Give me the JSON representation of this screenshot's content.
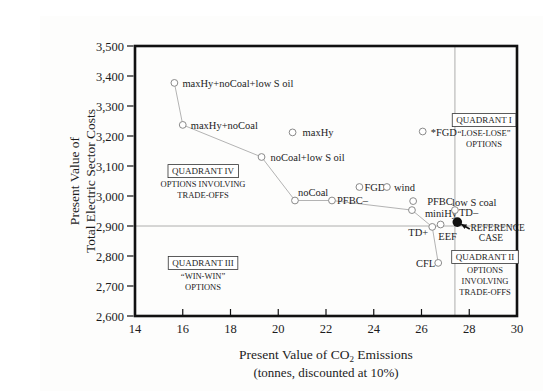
{
  "chart_data": {
    "type": "scatter",
    "title": "",
    "xlabel_line1": "Present Value of CO2 Emissions",
    "xlabel_line2": "(tonnes, discounted at 10%)",
    "ylabel_lines": [
      "Present Value of",
      "Total Electric Sector Costs"
    ],
    "xlim": [
      14,
      30
    ],
    "ylim": [
      2600,
      3500
    ],
    "xticks": [
      14,
      16,
      18,
      20,
      22,
      24,
      26,
      28,
      30
    ],
    "yticks": [
      2600,
      2700,
      2800,
      2900,
      3000,
      3100,
      3200,
      3300,
      3400,
      3500
    ],
    "grid": false,
    "colors": {
      "frame": "#111111",
      "curve": "#aaaaaa",
      "marker_stroke": "#8a8a8a",
      "reference_line": "#999999",
      "reference_dot": "#111111",
      "text": "#1c1c1c"
    },
    "points": [
      {
        "name": "maxHy-noCoal-lowSoil",
        "label": "maxHy+noCoal+low S oil",
        "x": 15.65,
        "y": 3377,
        "marker": "open",
        "anchor": "start",
        "dx": 8,
        "dy": 4
      },
      {
        "name": "maxHy-noCoal",
        "label": "maxHy+noCoal",
        "x": 16.0,
        "y": 3237,
        "marker": "open",
        "anchor": "start",
        "dx": 8,
        "dy": 4
      },
      {
        "name": "maxHy",
        "label": "maxHy",
        "x": 20.6,
        "y": 3212,
        "marker": "open",
        "anchor": "start",
        "dx": 10,
        "dy": 4
      },
      {
        "name": "noCoal-lowSoil",
        "label": "noCoal+low S oil",
        "x": 19.3,
        "y": 3130,
        "marker": "open",
        "anchor": "start",
        "dx": 9,
        "dy": 4
      },
      {
        "name": "noCoal",
        "label": "noCoal",
        "x": 20.7,
        "y": 2985,
        "marker": "open",
        "anchor": "start",
        "dx": 3,
        "dy": -5
      },
      {
        "name": "PFBC-minus",
        "label": "PFBC–",
        "x": 22.25,
        "y": 2985,
        "marker": "open",
        "anchor": "start",
        "dx": 5,
        "dy": 3
      },
      {
        "name": "FGD",
        "label": "FGD",
        "x": 23.4,
        "y": 3030,
        "marker": "open",
        "anchor": "start",
        "dx": 5,
        "dy": 4
      },
      {
        "name": "wind",
        "label": "wind",
        "x": 24.55,
        "y": 3030,
        "marker": "open",
        "anchor": "start",
        "dx": 7,
        "dy": 4
      },
      {
        "name": "star-FGD",
        "label": "*FGD",
        "x": 26.05,
        "y": 3215,
        "marker": "open",
        "anchor": "start",
        "dx": 8,
        "dy": 4
      },
      {
        "name": "PFBC",
        "label": "PFBC",
        "x": 25.65,
        "y": 2983,
        "marker": "open",
        "anchor": "start",
        "dx": 14,
        "dy": 4
      },
      {
        "name": "miniHy",
        "label": "miniHy",
        "x": 25.6,
        "y": 2953,
        "marker": "open",
        "anchor": "start",
        "dx": 13,
        "dy": 7
      },
      {
        "name": "TD-plus",
        "label": "TD+",
        "x": 26.45,
        "y": 2897,
        "marker": "open",
        "anchor": "end",
        "dx": -4,
        "dy": 9
      },
      {
        "name": "EEF",
        "label": "EEF",
        "x": 26.8,
        "y": 2905,
        "marker": "open",
        "anchor": "middle",
        "dx": 7,
        "dy": 15
      },
      {
        "name": "TD-minus",
        "label": "TD–",
        "x": 27.4,
        "y": 2953,
        "marker": "open",
        "anchor": "start",
        "dx": 4,
        "dy": 6
      },
      {
        "name": "CFL",
        "label": "CFL",
        "x": 26.7,
        "y": 2777,
        "marker": "open",
        "anchor": "end",
        "dx": -3,
        "dy": 4
      },
      {
        "name": "reference-case",
        "label": "",
        "x": 27.5,
        "y": 2913,
        "marker": "filled",
        "anchor": "start",
        "dx": 0,
        "dy": 0
      }
    ],
    "connected_path": [
      "maxHy-noCoal-lowSoil",
      "maxHy-noCoal",
      "noCoal-lowSoil",
      "noCoal",
      "PFBC-minus",
      "miniHy",
      "TD-plus",
      "CFL"
    ],
    "reference_lines": {
      "horizontal_y": 2900,
      "vertical_x": 27.4
    },
    "annotations": [
      {
        "name": "low-s-coal-label",
        "text": "low S coal",
        "x": 27.28,
        "y": 2967,
        "anchor": "start",
        "size": 10.5
      },
      {
        "name": "reference-case-line1",
        "text": "REFERENCE",
        "x": 28.05,
        "y": 2883,
        "anchor": "start",
        "size": 9.5
      },
      {
        "name": "reference-case-line2",
        "text": "CASE",
        "x": 28.4,
        "y": 2850,
        "anchor": "start",
        "size": 9.5
      }
    ],
    "reference_arrow": {
      "from_x": 28.02,
      "from_y": 2890,
      "to_x": 27.66,
      "to_y": 2906
    },
    "quadrants": [
      {
        "name": "quadrant-1",
        "title": "QUADRANT I",
        "lines": [
          "“LOSE-LOSE”",
          "OPTIONS"
        ],
        "x": 28.62,
        "y": 3253
      },
      {
        "name": "quadrant-2",
        "title": "QUADRANT II",
        "lines": [
          "OPTIONS",
          "INVOLVING",
          "TRADE-OFFS"
        ],
        "x": 28.66,
        "y": 2797
      },
      {
        "name": "quadrant-3",
        "title": "QUADRANT III",
        "lines": [
          "“WIN-WIN”",
          "OPTIONS"
        ],
        "x": 16.85,
        "y": 2777
      },
      {
        "name": "quadrant-4",
        "title": "QUADRANT IV",
        "lines": [
          "OPTIONS INVOLVING",
          "TRADE-OFFS"
        ],
        "x": 16.85,
        "y": 3083
      }
    ]
  }
}
